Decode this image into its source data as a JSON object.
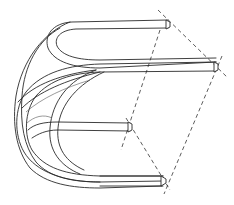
{
  "figure": {
    "stroke_color": "#2a2a2a",
    "background": "#ffffff",
    "rods": [
      {
        "name": "top-rod",
        "end": [
          168,
          24
        ]
      },
      {
        "name": "upper-middle-rod",
        "end": [
          217,
          67
        ]
      },
      {
        "name": "lower-middle-rod",
        "end": [
          130,
          127
        ]
      },
      {
        "name": "bottom-rod",
        "end": [
          164,
          181
        ]
      }
    ],
    "dashed_lines": [
      {
        "from": [
          158,
          10
        ],
        "to": [
          228,
          78
        ]
      },
      {
        "from": [
          159,
          30
        ],
        "to": [
          121,
          150
        ]
      },
      {
        "from": [
          222,
          56
        ],
        "to": [
          164,
          194
        ]
      },
      {
        "from": [
          126,
          118
        ],
        "to": [
          170,
          190
        ]
      }
    ]
  }
}
